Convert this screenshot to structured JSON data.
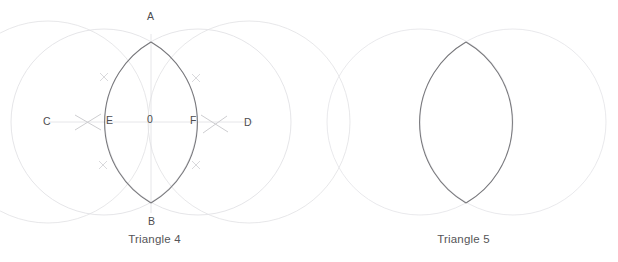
{
  "page": {
    "background_color": "#ffffff",
    "width": 618,
    "height": 262
  },
  "figures": [
    {
      "id": "triangle-4",
      "caption": "Triangle 4",
      "description": "Vesica piscis construction with two large guide circles, two arc circles forming a lens, horizontal line CD, vertical line AB, and faint compass intersection marks.",
      "labels": [
        {
          "name": "A",
          "text": "A",
          "x": 147,
          "y": 10
        },
        {
          "name": "B",
          "text": "B",
          "x": 148,
          "y": 215
        },
        {
          "name": "C",
          "text": "C",
          "x": 43,
          "y": 115
        },
        {
          "name": "D",
          "text": "D",
          "x": 244,
          "y": 116
        },
        {
          "name": "E",
          "text": "E",
          "x": 106,
          "y": 114
        },
        {
          "name": "F",
          "text": "F",
          "x": 190,
          "y": 114
        },
        {
          "name": "O",
          "text": "0",
          "x": 147,
          "y": 113
        }
      ],
      "colors": {
        "guide_circle": "#e3e3e6",
        "arc_circle": "#6e6e72",
        "construction_line": "#e0e0e3",
        "tick_mark": "#cfcfd3",
        "label_text": "#4d4d50"
      }
    },
    {
      "id": "triangle-5",
      "caption": "Triangle 5",
      "description": "Plain vesica piscis: two faint circles whose overlapping region forms a dark lens outline.",
      "labels": [],
      "colors": {
        "guide_circle": "#e7e7ea",
        "arc_circle": "#6e6e72"
      }
    }
  ],
  "geometry": {
    "left": {
      "center_y": 122,
      "guide_circle_left": {
        "cx": 48,
        "cy": 122,
        "r": 101
      },
      "guide_circle_right": {
        "cx": 249,
        "cy": 122,
        "r": 101
      },
      "lens_circle_left": {
        "cx": 104,
        "cy": 122,
        "r": 93
      },
      "lens_circle_right": {
        "cx": 198,
        "cy": 122,
        "r": 93
      },
      "horizontal_line": {
        "x1": 48,
        "x2": 253,
        "y": 122
      },
      "vertical_line": {
        "x": 151,
        "y1": 34,
        "y2": 213
      },
      "lens_top": {
        "x": 151,
        "y": 42
      },
      "lens_bottom": {
        "x": 151,
        "y": 203
      }
    },
    "right": {
      "center_y": 122,
      "circle_left": {
        "cx": 420,
        "cy": 122,
        "r": 93
      },
      "circle_right": {
        "cx": 513,
        "cy": 122,
        "r": 93
      },
      "lens_top": {
        "x": 466,
        "y": 42
      },
      "lens_bottom": {
        "x": 466,
        "y": 203
      }
    }
  },
  "marks": {
    "small_crosses": [
      {
        "name": "cross-upper-left",
        "x": 104,
        "y": 77
      },
      {
        "name": "cross-upper-right",
        "x": 196,
        "y": 78
      },
      {
        "name": "cross-lower-left",
        "x": 103,
        "y": 165
      },
      {
        "name": "cross-lower-right",
        "x": 196,
        "y": 165
      }
    ],
    "large_crosses": [
      {
        "name": "cross-left-axis",
        "x": 88,
        "y": 122
      },
      {
        "name": "cross-right-axis",
        "x": 214,
        "y": 124
      }
    ]
  }
}
